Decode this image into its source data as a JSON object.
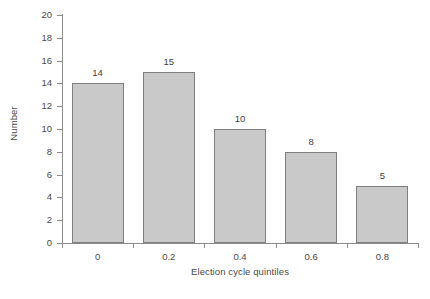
{
  "chart_data": {
    "type": "bar",
    "title": "",
    "xlabel": "Election cycle quintiles",
    "ylabel": "Number",
    "categories": [
      "0",
      "0.2",
      "0.4",
      "0.6",
      "0.8"
    ],
    "values": [
      14,
      15,
      10,
      8,
      5
    ],
    "value_labels": [
      "14",
      "15",
      "10",
      "8",
      "5"
    ],
    "ylim": [
      0,
      20
    ],
    "ytick_labels": [
      "0",
      "2",
      "4",
      "6",
      "8",
      "10",
      "12",
      "14",
      "16",
      "18",
      "20"
    ],
    "ytick_values": [
      0,
      2,
      4,
      6,
      8,
      10,
      12,
      14,
      16,
      18,
      20
    ],
    "xtick_labels": [
      "0",
      "0.2",
      "0.4",
      "0.6",
      "0.8"
    ],
    "grid": false,
    "legend": null,
    "legend_position": "none",
    "bar_fill_color": "#c9c9c9",
    "bar_border_color": "#7f7f7f",
    "axis_color": "#8c8c8c",
    "text_color": "#4a4a4a",
    "background_color": "#ffffff"
  }
}
